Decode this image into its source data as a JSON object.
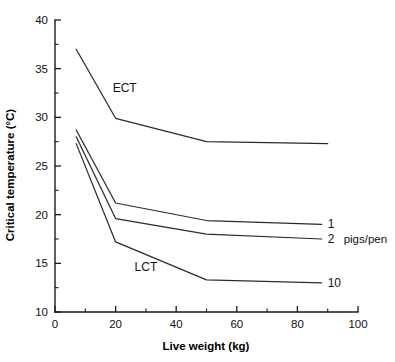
{
  "chart_data": {
    "type": "line",
    "title": "",
    "xlabel": "Live weight (kg)",
    "ylabel": "Critical temperature (°C)",
    "xlim": [
      0,
      100
    ],
    "ylim": [
      10,
      40
    ],
    "x_major_ticks": [
      0,
      20,
      40,
      60,
      80,
      100
    ],
    "x_minor_ticks": [
      10,
      30,
      50,
      70,
      90
    ],
    "y_major_ticks": [
      10,
      15,
      20,
      25,
      30,
      35,
      40
    ],
    "y_minor_ticks": [
      12.5,
      17.5,
      22.5,
      27.5,
      32.5,
      37.5
    ],
    "x_tick_labels": [
      "0",
      "20",
      "40",
      "60",
      "80",
      "100"
    ],
    "y_tick_labels": [
      "10",
      "15",
      "20",
      "25",
      "30",
      "35",
      "40"
    ],
    "grid": false,
    "legend_position": "right-inline",
    "legend_unit": "pigs/pen",
    "annotations": [
      {
        "text": "ECT",
        "x": 23,
        "y": 32.6
      },
      {
        "text": "LCT",
        "x": 30,
        "y": 14.2
      }
    ],
    "series": [
      {
        "name": "ECT",
        "label": "",
        "x": [
          7,
          20,
          50,
          90
        ],
        "y": [
          37.0,
          29.9,
          27.5,
          27.3
        ]
      },
      {
        "name": "LCT 1 pig/pen",
        "label": "1",
        "x": [
          7,
          20,
          50,
          88
        ],
        "y": [
          28.7,
          21.2,
          19.4,
          19.0
        ]
      },
      {
        "name": "LCT 2 pigs/pen",
        "label": "2",
        "x": [
          7,
          20,
          50,
          88
        ],
        "y": [
          28.0,
          19.6,
          18.0,
          17.5
        ]
      },
      {
        "name": "LCT 10 pigs/pen",
        "label": "10",
        "x": [
          7,
          20,
          50,
          88
        ],
        "y": [
          27.3,
          17.2,
          13.3,
          13.0
        ]
      }
    ]
  }
}
